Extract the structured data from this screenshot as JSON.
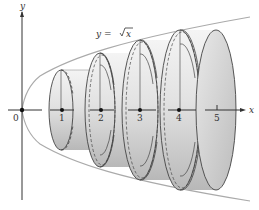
{
  "figure": {
    "curve_label": "y = √x",
    "curve_label_prefix": "y = ",
    "curve_label_radicand": "x",
    "axis_labels": {
      "x": "x",
      "y": "y"
    },
    "origin_label": "0",
    "tick_labels": [
      "1",
      "2",
      "3",
      "4",
      "5"
    ],
    "disks": [
      {
        "index": 1,
        "center_label": "1"
      },
      {
        "index": 2,
        "center_label": "2"
      },
      {
        "index": 3,
        "center_label": "3"
      },
      {
        "index": 4,
        "center_label": "4"
      }
    ],
    "colors": {
      "curve": "#a8a8a8",
      "axis": "#333333",
      "disk_fill_light": "#f2f2f2",
      "disk_fill_dark": "#bdbdbd",
      "disk_edge": "#444444"
    }
  }
}
